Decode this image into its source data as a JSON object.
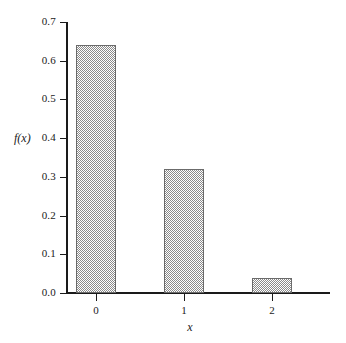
{
  "chart_data": {
    "type": "bar",
    "title": "",
    "subtitle": "",
    "xlabel": "x",
    "ylabel": "f(x)",
    "categories": [
      "0",
      "1",
      "2"
    ],
    "values": [
      0.64,
      0.32,
      0.04
    ],
    "series": [
      {
        "name": "f(x)",
        "values": [
          0.64,
          0.32,
          0.04
        ]
      }
    ],
    "ylim": [
      0.0,
      0.7
    ],
    "xlim": [
      -0.5,
      2.5
    ],
    "ytick_labels": [
      "0.0",
      "0.1",
      "0.2",
      "0.3",
      "0.4",
      "0.5",
      "0.6",
      "0.7"
    ],
    "ytick_values": [
      0.0,
      0.1,
      0.2,
      0.3,
      0.4,
      0.5,
      0.6,
      0.7
    ],
    "xtick_labels": [
      "0",
      "1",
      "2"
    ],
    "grid": false,
    "legend": null,
    "legend_position": "none",
    "annotations": [],
    "bar_fill_color": "#8a8a8a",
    "bar_edge_color": "#6b6b6b",
    "axis_color": "#1a1a1a",
    "background_color": "#ffffff"
  },
  "caption": {
    "sliver_text": ""
  }
}
